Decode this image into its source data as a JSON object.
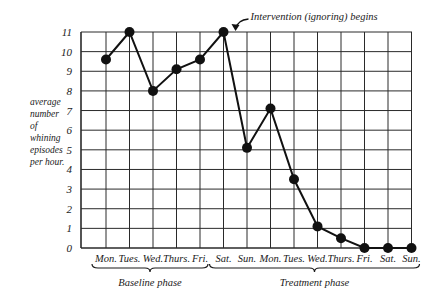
{
  "chart_data": {
    "type": "line",
    "title": "",
    "xlabel": "",
    "ylabel": "average number of whining episodes per hour.",
    "ylabel_lines": [
      "average",
      "number",
      "of",
      "whining",
      "episodes",
      "per hour."
    ],
    "yticks": [
      0,
      1,
      2,
      3,
      4,
      5,
      6,
      7,
      8,
      9,
      10,
      11
    ],
    "ylim": [
      0,
      11
    ],
    "grid": true,
    "categories": [
      "Mon.",
      "Tues.",
      "Wed.",
      "Thurs.",
      "Fri.",
      "Sat.",
      "Sun.",
      "Mon.",
      "Tues.",
      "Wed.",
      "Thurs.",
      "Fri.",
      "Sat.",
      "Sun."
    ],
    "series": [
      {
        "name": "Whining episodes per hour",
        "values": [
          9.6,
          11,
          8,
          9.1,
          9.6,
          11,
          5.1,
          7.1,
          3.5,
          1.1,
          0.5,
          0,
          0,
          0
        ]
      }
    ],
    "phases": [
      {
        "label": "Baseline phase",
        "start": 0,
        "end": 4
      },
      {
        "label": "Treatment phase",
        "start": 5,
        "end": 13
      }
    ],
    "annotations": [
      {
        "text": "Intervention (ignoring) begins",
        "points_to_index": 5
      }
    ],
    "legend": "none"
  }
}
